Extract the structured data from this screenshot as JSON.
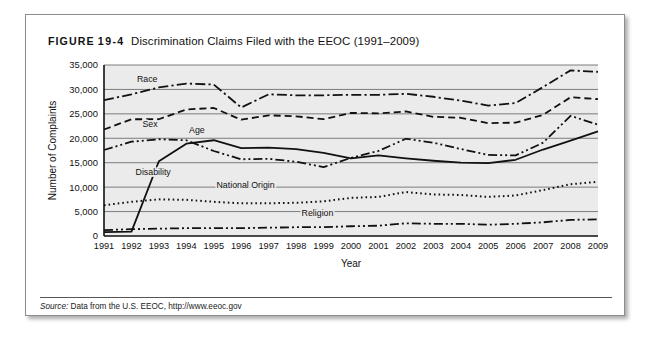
{
  "figure": {
    "label_word": "FIGURE",
    "label_number": "19-4",
    "caption": "Discrimination Claims Filed with the EEOC (1991–2009)"
  },
  "source": {
    "label": "Source:",
    "text": " Data from the U.S. EEOC, http://www.eeoc.gov"
  },
  "chart_data": {
    "type": "line",
    "title": "Discrimination Claims Filed with the EEOC (1991–2009)",
    "xlabel": "Year",
    "ylabel": "Number of Complaints",
    "xlim": [
      1991,
      2009
    ],
    "ylim": [
      0,
      35000
    ],
    "ytick_values": [
      0,
      5000,
      10000,
      15000,
      20000,
      25000,
      30000,
      35000
    ],
    "ytick_labels": [
      "0",
      "5,000",
      "10,000",
      "15,000",
      "20,000",
      "25,000",
      "30,000",
      "35,000"
    ],
    "grid": true,
    "legend": "inline-labels",
    "x": [
      1991,
      1992,
      1993,
      1994,
      1995,
      1996,
      1997,
      1998,
      1999,
      2000,
      2001,
      2002,
      2003,
      2004,
      2005,
      2006,
      2007,
      2008,
      2009
    ],
    "xtick_labels": [
      "1991",
      "1992",
      "1993",
      "1994",
      "1995",
      "1996",
      "1997",
      "1998",
      "1999",
      "2000",
      "2001",
      "2002",
      "2003",
      "2004",
      "2005",
      "2006",
      "2007",
      "2008",
      "2009"
    ],
    "series": [
      {
        "name": "Race",
        "dash": "dashdot",
        "label_x": 1992.2,
        "label_y": 31600,
        "values": [
          27800,
          29000,
          30400,
          31200,
          31000,
          26300,
          29000,
          28800,
          28800,
          28900,
          28900,
          29100,
          28500,
          27700,
          26700,
          27200,
          30500,
          33900,
          33600
        ]
      },
      {
        "name": "Sex",
        "dash": "dash",
        "label_x": 1992.4,
        "label_y": 22400,
        "values": [
          21800,
          23900,
          23900,
          25900,
          26200,
          23800,
          24700,
          24500,
          23900,
          25200,
          25100,
          25500,
          24400,
          24200,
          23100,
          23200,
          24800,
          28400,
          28000
        ]
      },
      {
        "name": "Age",
        "dash": "dashdotdot",
        "label_x": 1994.1,
        "label_y": 21100,
        "values": [
          17600,
          19300,
          19800,
          19600,
          17400,
          15700,
          15800,
          15200,
          14100,
          16000,
          17400,
          19900,
          19100,
          17800,
          16600,
          16500,
          19100,
          24600,
          22800
        ]
      },
      {
        "name": "Disability",
        "dash": "solid",
        "label_x": 1992.15,
        "label_y": 12500,
        "values": [
          800,
          900,
          15300,
          18900,
          19600,
          18000,
          18100,
          17800,
          17000,
          15900,
          16500,
          15900,
          15400,
          15000,
          14900,
          15600,
          17700,
          19500,
          21400
        ]
      },
      {
        "name": "National Origin",
        "dash": "dot",
        "label_x": 1995.1,
        "label_y": 9900,
        "values": [
          6300,
          7000,
          7500,
          7400,
          7000,
          6700,
          6700,
          6800,
          7100,
          7800,
          8000,
          9000,
          8500,
          8400,
          8000,
          8300,
          9400,
          10600,
          11100
        ]
      },
      {
        "name": "Religion",
        "dash": "dashdotdot",
        "label_x": 1998.2,
        "label_y": 4000,
        "values": [
          1200,
          1400,
          1500,
          1600,
          1600,
          1600,
          1700,
          1800,
          1800,
          2000,
          2100,
          2600,
          2500,
          2500,
          2300,
          2500,
          2800,
          3300,
          3400
        ]
      }
    ]
  }
}
